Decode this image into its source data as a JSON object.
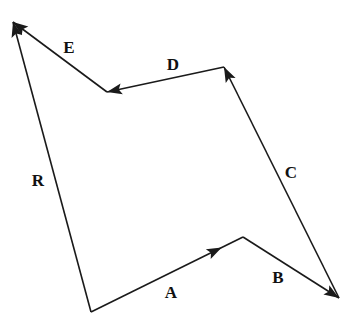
{
  "diagram": {
    "type": "vector-addition",
    "stroke_color": "#1a1a1a",
    "background": "#ffffff",
    "points": {
      "O": [
        91,
        312
      ],
      "P1": [
        243,
        237
      ],
      "P2": [
        339,
        298
      ],
      "P3": [
        224,
        67
      ],
      "P4": [
        107,
        92
      ],
      "P5": [
        13,
        22
      ]
    },
    "vectors": [
      {
        "name": "A",
        "from": "O",
        "to": "P1",
        "label": "A",
        "label_pos": [
          171,
          298
        ],
        "arrow": "mid"
      },
      {
        "name": "B",
        "from": "P1",
        "to": "P2",
        "label": "B",
        "label_pos": [
          278,
          283
        ],
        "arrow": "end"
      },
      {
        "name": "C",
        "from": "P2",
        "to": "P3",
        "label": "C",
        "label_pos": [
          291,
          178
        ],
        "arrow": "end"
      },
      {
        "name": "D",
        "from": "P3",
        "to": "P4",
        "label": "D",
        "label_pos": [
          173,
          70
        ],
        "arrow": "end"
      },
      {
        "name": "E",
        "from": "P4",
        "to": "P5",
        "label": "E",
        "label_pos": [
          69,
          53
        ],
        "arrow": "end"
      },
      {
        "name": "R",
        "from": "O",
        "to": "P5",
        "label": "R",
        "label_pos": [
          38,
          186
        ],
        "arrow": "end"
      }
    ]
  }
}
